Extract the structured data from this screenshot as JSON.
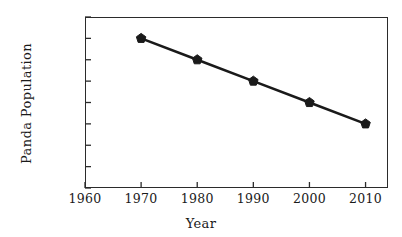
{
  "chart_data": {
    "type": "line",
    "title": "",
    "xlabel": "Year",
    "ylabel": "Panda Population",
    "x": [
      1970,
      1980,
      1990,
      2000,
      2010
    ],
    "values": [
      7000,
      6000,
      5000,
      4000,
      3000
    ],
    "series": [
      {
        "name": "Panda Population",
        "values": [
          7000,
          6000,
          5000,
          4000,
          3000
        ]
      }
    ],
    "xlim": [
      1960,
      2014
    ],
    "ylim": [
      0,
      8000
    ],
    "xticks": [
      1960,
      1970,
      1980,
      1990,
      2000,
      2010
    ],
    "xtick_labels": [
      "1960",
      "1970",
      "1980",
      "1990",
      "2000",
      "2010"
    ],
    "yticks": [
      0,
      1000,
      2000,
      3000,
      4000,
      5000,
      6000,
      7000,
      8000
    ],
    "ytick_labels": [
      "0000",
      "1000",
      "2000",
      "3000",
      "4000",
      "5000",
      "6000",
      "7000",
      "8000"
    ],
    "grid": false,
    "legend": null,
    "marker": "pentagon",
    "line_color": "#1a1a1a",
    "marker_color": "#1a1a1a",
    "axis_color": "#2b2b2b",
    "background_color": "#ffffff"
  }
}
